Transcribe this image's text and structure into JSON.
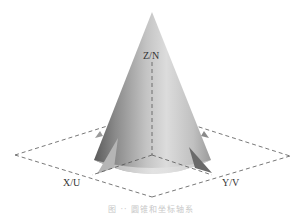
{
  "figure": {
    "axes": {
      "z_label": "Z/N",
      "x_label": "X/U",
      "y_label": "Y/V"
    },
    "caption": "图 ·· 圆锥和坐标轴系",
    "colors": {
      "cone_light": "#e6e6e6",
      "cone_dark": "#6e6e6e",
      "dash": "#555555",
      "caption": "#c8c8c8"
    }
  }
}
